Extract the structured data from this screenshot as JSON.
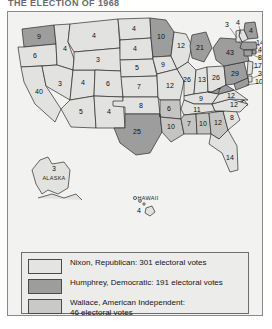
{
  "title": "THE ELECTION OF 1968",
  "map": {
    "alaska_label": "ALASKA",
    "hawaii_label": "HAWAII",
    "states": [
      {
        "code": "WA",
        "votes": "9",
        "party": "humphrey"
      },
      {
        "code": "OR",
        "votes": "6",
        "party": "nixon"
      },
      {
        "code": "CA",
        "votes": "40",
        "party": "nixon"
      },
      {
        "code": "ID",
        "votes": "4",
        "party": "nixon"
      },
      {
        "code": "NV",
        "votes": "3",
        "party": "nixon"
      },
      {
        "code": "UT",
        "votes": "4",
        "party": "nixon"
      },
      {
        "code": "AZ",
        "votes": "5",
        "party": "nixon"
      },
      {
        "code": "MT",
        "votes": "4",
        "party": "nixon"
      },
      {
        "code": "WY",
        "votes": "3",
        "party": "nixon"
      },
      {
        "code": "CO",
        "votes": "6",
        "party": "nixon"
      },
      {
        "code": "NM",
        "votes": "4",
        "party": "nixon"
      },
      {
        "code": "ND",
        "votes": "4",
        "party": "nixon"
      },
      {
        "code": "SD",
        "votes": "4",
        "party": "nixon"
      },
      {
        "code": "NE",
        "votes": "5",
        "party": "nixon"
      },
      {
        "code": "KS",
        "votes": "7",
        "party": "nixon"
      },
      {
        "code": "OK",
        "votes": "8",
        "party": "nixon"
      },
      {
        "code": "TX",
        "votes": "25",
        "party": "humphrey"
      },
      {
        "code": "MN",
        "votes": "10",
        "party": "humphrey"
      },
      {
        "code": "IA",
        "votes": "9",
        "party": "nixon"
      },
      {
        "code": "MO",
        "votes": "12",
        "party": "nixon"
      },
      {
        "code": "AR",
        "votes": "6",
        "party": "wallace"
      },
      {
        "code": "LA",
        "votes": "10",
        "party": "wallace"
      },
      {
        "code": "WI",
        "votes": "12",
        "party": "nixon"
      },
      {
        "code": "MI",
        "votes": "21",
        "party": "humphrey"
      },
      {
        "code": "IL",
        "votes": "26",
        "party": "nixon"
      },
      {
        "code": "IN",
        "votes": "13",
        "party": "nixon"
      },
      {
        "code": "OH",
        "votes": "26",
        "party": "nixon"
      },
      {
        "code": "KY",
        "votes": "9",
        "party": "nixon"
      },
      {
        "code": "TN",
        "votes": "11",
        "party": "nixon"
      },
      {
        "code": "MS",
        "votes": "7",
        "party": "wallace"
      },
      {
        "code": "AL",
        "votes": "10",
        "party": "wallace"
      },
      {
        "code": "GA",
        "votes": "12",
        "party": "wallace"
      },
      {
        "code": "FL",
        "votes": "14",
        "party": "nixon"
      },
      {
        "code": "SC",
        "votes": "8",
        "party": "nixon"
      },
      {
        "code": "NC",
        "votes": "12",
        "party": "nixon"
      },
      {
        "code": "VA",
        "votes": "12",
        "party": "nixon"
      },
      {
        "code": "WV",
        "votes": "7",
        "party": "humphrey"
      },
      {
        "code": "PA",
        "votes": "29",
        "party": "humphrey"
      },
      {
        "code": "NY",
        "votes": "43",
        "party": "humphrey"
      },
      {
        "code": "ME",
        "votes": "4",
        "party": "humphrey"
      },
      {
        "code": "NH",
        "votes": "4",
        "party": "nixon"
      },
      {
        "code": "VT",
        "votes": "3",
        "party": "nixon"
      },
      {
        "code": "MA",
        "votes": "14",
        "party": "humphrey"
      },
      {
        "code": "RI",
        "votes": "4",
        "party": "humphrey"
      },
      {
        "code": "CT",
        "votes": "8",
        "party": "humphrey"
      },
      {
        "code": "NJ",
        "votes": "17",
        "party": "nixon"
      },
      {
        "code": "DE",
        "votes": "3",
        "party": "nixon"
      },
      {
        "code": "MD",
        "votes": "10",
        "party": "humphrey"
      },
      {
        "code": "AK",
        "votes": "3",
        "party": "nixon"
      },
      {
        "code": "HI",
        "votes": "4",
        "party": "humphrey"
      }
    ]
  },
  "legend": {
    "items": [
      {
        "swatch": "nixon",
        "text": "Nixon, Republican: 301 electoral votes"
      },
      {
        "swatch": "humphrey",
        "text": "Humphrey, Democratic: 191 electoral votes"
      },
      {
        "swatch": "wallace",
        "text": "Wallace, American Independent:\n46 electoral votes"
      }
    ]
  },
  "colors": {
    "nixon": "#e2e2e0",
    "humphrey": "#9d9d9d",
    "wallace": "#c4c4c2",
    "outline": "#2b2b2b",
    "frame": "#8a8a8a",
    "panel": "#f2f2f0"
  }
}
